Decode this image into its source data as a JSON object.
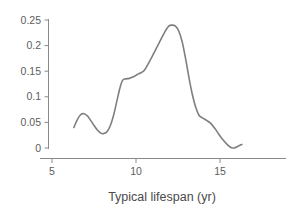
{
  "chart_data": {
    "type": "line",
    "title": "",
    "subtitle": "",
    "xlabel": "Typical lifespan (yr)",
    "ylabel": "",
    "xlim": [
      5.0,
      18.0
    ],
    "ylim": [
      0.0,
      0.26
    ],
    "grid": false,
    "legend": null,
    "series_color": "#7f7f7f",
    "axis_color": "#8a8a8a",
    "tick_label_color": "#5d5d5d",
    "background_color": "#ffffff",
    "x_ticks": [
      {
        "value": 5,
        "label": "5"
      },
      {
        "value": 10,
        "label": "10"
      },
      {
        "value": 15,
        "label": "15"
      }
    ],
    "y_ticks": [
      {
        "value": 0,
        "label": "0"
      },
      {
        "value": 0.05,
        "label": "0.05"
      },
      {
        "value": 0.1,
        "label": "0.1"
      },
      {
        "value": 0.15,
        "label": "0.15"
      },
      {
        "value": 0.2,
        "label": "0.2"
      },
      {
        "value": 0.25,
        "label": "0.25"
      }
    ],
    "series": [
      {
        "name": "density",
        "x": [
          6.3,
          6.5,
          6.7,
          6.9,
          7.1,
          7.3,
          7.5,
          7.7,
          7.9,
          8.05,
          8.25,
          8.45,
          8.65,
          8.85,
          9.05,
          9.2,
          9.4,
          9.6,
          9.85,
          10.1,
          10.3,
          10.5,
          10.7,
          10.95,
          11.2,
          11.45,
          11.7,
          11.95,
          12.15,
          12.35,
          12.55,
          12.75,
          12.95,
          13.15,
          13.35,
          13.55,
          13.75,
          13.95,
          14.2,
          14.45,
          14.7,
          14.95,
          15.2,
          15.45,
          15.65,
          15.85,
          16.05,
          16.3
        ],
        "y": [
          0.04,
          0.055,
          0.065,
          0.067,
          0.063,
          0.054,
          0.044,
          0.035,
          0.029,
          0.028,
          0.031,
          0.042,
          0.062,
          0.09,
          0.118,
          0.132,
          0.135,
          0.136,
          0.139,
          0.144,
          0.147,
          0.152,
          0.163,
          0.178,
          0.194,
          0.21,
          0.226,
          0.238,
          0.24,
          0.238,
          0.228,
          0.207,
          0.175,
          0.138,
          0.105,
          0.08,
          0.064,
          0.059,
          0.054,
          0.048,
          0.038,
          0.026,
          0.015,
          0.006,
          0.001,
          0.0,
          0.003,
          0.007
        ]
      }
    ]
  },
  "axis": {
    "x_title": "Typical lifespan (yr)"
  }
}
